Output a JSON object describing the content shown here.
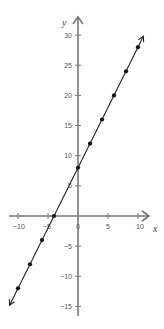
{
  "chart_data": {
    "type": "line",
    "title": "",
    "equation_depicted": "y = 2x + 8",
    "xlabel": "x",
    "ylabel": "y",
    "xlim": [
      -11,
      11
    ],
    "ylim": [
      -16,
      31
    ],
    "grid": false,
    "legend": null,
    "x_ticks": [
      -10,
      -5,
      0,
      5,
      10
    ],
    "x_tick_labels": [
      "−10",
      "−5",
      "0",
      "5",
      "10"
    ],
    "y_ticks": [
      -15,
      -10,
      -5,
      5,
      10,
      15,
      20,
      25,
      30
    ],
    "y_tick_labels": [
      "−15",
      "−10",
      "−5",
      "5",
      "10",
      "15",
      "20",
      "25",
      "30"
    ],
    "series": [
      {
        "name": "line",
        "color": "#222222",
        "x": [
          -10,
          -8,
          -6,
          -4,
          0,
          2,
          4,
          6,
          8,
          10
        ],
        "y": [
          -12,
          -8,
          -4,
          0,
          8,
          12,
          16,
          20,
          24,
          28
        ]
      }
    ],
    "line_extends_with_arrows": true
  },
  "colors": {
    "axis": "#777777",
    "line": "#222222",
    "point": "#111111",
    "text": "#555555"
  }
}
